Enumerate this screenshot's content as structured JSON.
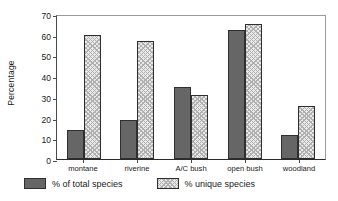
{
  "chart_data": {
    "type": "bar",
    "title": "",
    "xlabel": "",
    "ylabel": "Percentage",
    "ylim": [
      0,
      70
    ],
    "yticks": [
      0,
      10,
      20,
      30,
      40,
      50,
      60,
      70
    ],
    "grid": false,
    "legend_position": "bottom",
    "categories": [
      "montane",
      "riverine",
      "A/C bush",
      "open bush",
      "woodland"
    ],
    "series": [
      {
        "name": "% of total species",
        "color": "#666666",
        "fill": "solid-dark-gray",
        "values": [
          14,
          19,
          35,
          62.5,
          11.5
        ]
      },
      {
        "name": "% unique species",
        "color": "#e9e9e9",
        "fill": "light-cross-hatch",
        "values": [
          60,
          57,
          31,
          65,
          25.5
        ]
      }
    ]
  },
  "axis": {
    "y_title": "Percentage",
    "y_tick_labels": [
      "0",
      "10",
      "20",
      "30",
      "40",
      "50",
      "60",
      "70"
    ],
    "x_tick_labels": [
      "montane",
      "riverine",
      "A/C bush",
      "open bush",
      "woodland"
    ]
  },
  "legend": {
    "items": [
      {
        "label": "% of total species",
        "swatch": "solid-dark-gray-swatch"
      },
      {
        "label": "% unique species",
        "swatch": "hatched-light-swatch"
      }
    ]
  }
}
